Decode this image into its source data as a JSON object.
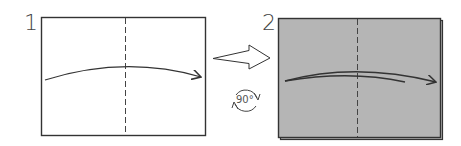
{
  "diagram": {
    "type": "origami-instructions",
    "steps": [
      {
        "number": "1",
        "paper_color": "#ffffff",
        "has_crease": true,
        "arrow": "fold-right"
      },
      {
        "number": "2",
        "paper_color": "#b5b5b5",
        "has_crease": true,
        "arrow": "fold-right-layered"
      }
    ],
    "transition": {
      "arrow": "hollow-right",
      "rotation_label": "90°"
    }
  },
  "colors": {
    "line": "#333333",
    "paper_back": "#b5b5b5",
    "paper_front": "#ffffff"
  }
}
